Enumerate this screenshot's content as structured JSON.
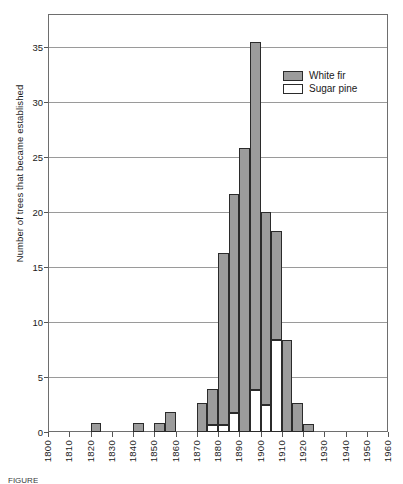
{
  "figure": {
    "caption_fragment": "FIGURE"
  },
  "legend": {
    "position": "top-right-inside",
    "entries": [
      {
        "label": "White fir",
        "color": "#9c9c9c",
        "key": "white_fir"
      },
      {
        "label": "Sugar pine",
        "color": "#ffffff",
        "key": "sugar_pine"
      }
    ]
  },
  "chart_data": {
    "type": "bar",
    "subtype": "stacked-histogram",
    "title": "",
    "xlabel": "",
    "ylabel": "Number of trees that became established",
    "xlim": [
      1800,
      1960
    ],
    "ylim": [
      0,
      38
    ],
    "y_tick_step": 5,
    "x_tick_step": 10,
    "bin_width_years": 5,
    "grid": "horizontal",
    "yticks": [
      0,
      5,
      10,
      15,
      20,
      25,
      30,
      35
    ],
    "ytick_labels": [
      "0",
      "5",
      "10",
      "15",
      "20",
      "25",
      "30",
      "35"
    ],
    "xticks": [
      1800,
      1810,
      1820,
      1830,
      1840,
      1850,
      1860,
      1870,
      1880,
      1890,
      1900,
      1910,
      1920,
      1930,
      1940,
      1950,
      1960
    ],
    "xtick_labels": [
      "1800",
      "1810",
      "1820",
      "1830",
      "1840",
      "1850",
      "1860",
      "1870",
      "1880",
      "1890",
      "1900",
      "1910",
      "1920",
      "1930",
      "1940",
      "1950",
      "1960"
    ],
    "categories": [
      1820,
      1825,
      1830,
      1835,
      1840,
      1845,
      1850,
      1855,
      1860,
      1865,
      1870,
      1875,
      1880,
      1885,
      1890,
      1895,
      1900,
      1905,
      1910,
      1915,
      1920,
      1925
    ],
    "series": [
      {
        "name": "Sugar pine",
        "color": "#ffffff",
        "values": [
          0,
          0,
          0,
          0,
          0,
          0,
          0,
          0,
          0,
          0,
          0,
          0.6,
          0.6,
          1.7,
          0,
          3.8,
          2.5,
          8.4,
          0,
          0,
          0,
          0
        ]
      },
      {
        "name": "White fir",
        "color": "#9c9c9c",
        "values": [
          0.8,
          0,
          0,
          0,
          0.8,
          0,
          0.8,
          1.8,
          0,
          0,
          2.6,
          3.3,
          15.7,
          19.9,
          25.8,
          31.7,
          17.5,
          9.9,
          8.4,
          2.6,
          0.7,
          0
        ]
      }
    ],
    "stacked_totals": [
      0.8,
      0,
      0,
      0,
      0.8,
      0,
      0.8,
      1.8,
      0,
      0,
      2.6,
      3.9,
      16.3,
      21.6,
      25.8,
      35.5,
      20.0,
      18.3,
      8.4,
      2.6,
      0.7,
      0
    ]
  }
}
